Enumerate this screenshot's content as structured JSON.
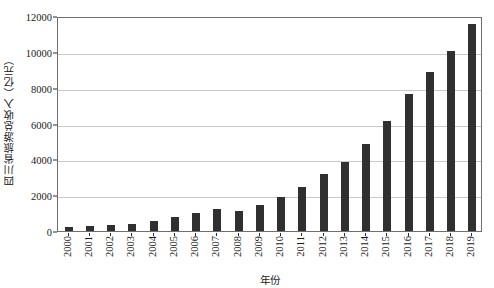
{
  "chart_data": {
    "type": "bar",
    "title": "",
    "xlabel": "年份",
    "ylabel": "四川省旅游总收入（亿元）",
    "categories": [
      "2000",
      "2001",
      "2002",
      "2003",
      "2004",
      "2005",
      "2006",
      "2007",
      "2008",
      "2009",
      "2010",
      "2011",
      "2012",
      "2013",
      "2014",
      "2015",
      "2016",
      "2017",
      "2018",
      "2019"
    ],
    "values": [
      250,
      300,
      350,
      380,
      550,
      780,
      1020,
      1220,
      1090,
      1470,
      1880,
      2450,
      3200,
      3860,
      4850,
      6150,
      7650,
      8890,
      10050,
      11560
    ],
    "ylim": [
      0,
      12000
    ],
    "yticks": [
      0,
      2000,
      4000,
      6000,
      8000,
      10000,
      12000
    ],
    "grid": "horizontal",
    "legend": "none",
    "bar_color": "#303030",
    "axis_color": "#6f6f6f",
    "grid_color": "#c9c9c9"
  }
}
